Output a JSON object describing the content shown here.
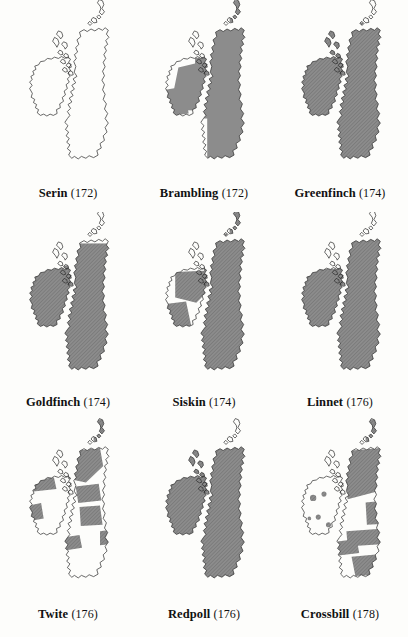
{
  "figure": {
    "type": "map-grid",
    "region": "British Isles",
    "background_color": "#fdfdfb",
    "outline_color": "#2b2b2b",
    "fill_gray": "#8c8c8c",
    "hatch_color": "#6e6e6e",
    "columns": 3,
    "rows": 3
  },
  "panels": [
    {
      "id": "serin",
      "species": "Serin",
      "page": "(172)",
      "fill_style": "none",
      "coverage_percent": 1,
      "row": 1,
      "col": 1,
      "regions_filled": []
    },
    {
      "id": "brambling",
      "species": "Brambling",
      "page": "(172)",
      "fill_style": "solid",
      "coverage_percent": 72,
      "row": 1,
      "col": 2,
      "regions_filled": [
        "England",
        "Wales",
        "Scotland",
        "E Ireland",
        "S Ireland"
      ]
    },
    {
      "id": "greenfinch",
      "species": "Greenfinch",
      "page": "(174)",
      "fill_style": "hatch",
      "coverage_percent": 88,
      "row": 1,
      "col": 3,
      "regions_filled": [
        "England",
        "Wales",
        "Scotland",
        "Ireland"
      ]
    },
    {
      "id": "goldfinch",
      "species": "Goldfinch",
      "page": "(174)",
      "fill_style": "hatch",
      "coverage_percent": 85,
      "row": 2,
      "col": 1,
      "regions_filled": [
        "England",
        "Wales",
        "S Scotland",
        "Ireland"
      ]
    },
    {
      "id": "siskin",
      "species": "Siskin",
      "page": "(174)",
      "fill_style": "hatch",
      "coverage_percent": 78,
      "row": 2,
      "col": 2,
      "regions_filled": [
        "Scotland",
        "N England",
        "Wales",
        "N Ireland",
        "S Ireland"
      ]
    },
    {
      "id": "linnet",
      "species": "Linnet",
      "page": "(176)",
      "fill_style": "hatch",
      "coverage_percent": 82,
      "row": 2,
      "col": 3,
      "regions_filled": [
        "England",
        "Wales",
        "S Scotland",
        "Ireland"
      ]
    },
    {
      "id": "twite",
      "species": "Twite",
      "page": "(176)",
      "fill_style": "mixed",
      "coverage_percent": 22,
      "row": 3,
      "col": 1,
      "regions_filled": [
        "NW Scotland",
        "Pennines",
        "N Wales coast",
        "W Ireland coast"
      ]
    },
    {
      "id": "redpoll",
      "species": "Redpoll",
      "page": "(176)",
      "fill_style": "hatch",
      "coverage_percent": 80,
      "row": 3,
      "col": 2,
      "regions_filled": [
        "Scotland",
        "England",
        "Wales",
        "Ireland"
      ]
    },
    {
      "id": "crossbill",
      "species": "Crossbill",
      "page": "(178)",
      "fill_style": "patchy",
      "coverage_percent": 35,
      "row": 3,
      "col": 3,
      "regions_filled": [
        "Highlands",
        "E England",
        "S England",
        "Wales"
      ]
    }
  ]
}
